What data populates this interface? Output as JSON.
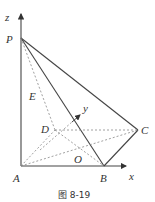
{
  "figure": {
    "caption": "图 8-19",
    "points": {
      "P": {
        "label": "P"
      },
      "A": {
        "label": "A"
      },
      "B": {
        "label": "B"
      },
      "C": {
        "label": "C"
      },
      "D": {
        "label": "D"
      },
      "O": {
        "label": "O"
      },
      "E": {
        "label": "E"
      }
    },
    "axes": {
      "x": {
        "label": "x"
      },
      "y": {
        "label": "y"
      },
      "z": {
        "label": "z"
      }
    },
    "colors": {
      "solid_line": "#444444",
      "dashed_line": "#888888"
    }
  }
}
